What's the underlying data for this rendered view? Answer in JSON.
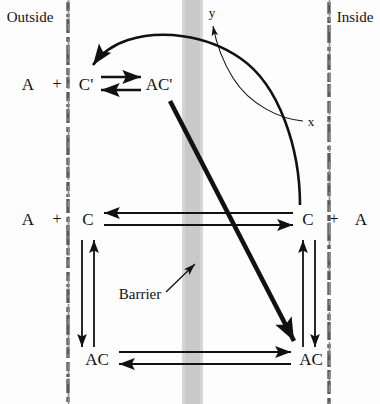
{
  "figure": {
    "type": "diagram",
    "background_color": "#fdfdfd",
    "ink_color": "#111111",
    "barrier_band_color": "#c9c9c9",
    "width": 380,
    "height": 404
  },
  "compartments": {
    "left_label": "Outside",
    "right_label": "Inside"
  },
  "barrier": {
    "label": "Barrier",
    "pointer": "arrow-up-right"
  },
  "axes": {
    "y_label": "y",
    "x_label": "x"
  },
  "rows": [
    {
      "id": "row-top",
      "left": {
        "reactant_a": "A",
        "plus": "+",
        "carrier": "C'",
        "complex": "AC'"
      }
    },
    {
      "id": "row-middle",
      "left": {
        "reactant_a": "A",
        "plus": "+",
        "carrier": "C"
      },
      "right": {
        "carrier": "C",
        "plus": "+",
        "reactant_a": "A"
      }
    },
    {
      "id": "row-bottom",
      "left": {
        "complex": "AC"
      },
      "right": {
        "complex": "AC"
      }
    }
  ],
  "arrows": {
    "top_equilibrium_forward": "A + C' to AC'",
    "top_equilibrium_reverse": "AC' to A + C'",
    "middle_transport_leftward": "inside C to outside C",
    "middle_transport_rightward": "outside C to inside C",
    "bottom_transport_rightward": "outside AC to inside AC",
    "bottom_transport_leftward": "inside AC to outside AC",
    "left_vertical_down": "A + C to AC",
    "left_vertical_up": "AC to A + C",
    "right_vertical_up": "AC to C + A",
    "right_vertical_down": "C + A to AC",
    "curved_recycle": "inside to outside carrier regeneration to C'",
    "thick_diagonal": "AC' to inside AC"
  }
}
